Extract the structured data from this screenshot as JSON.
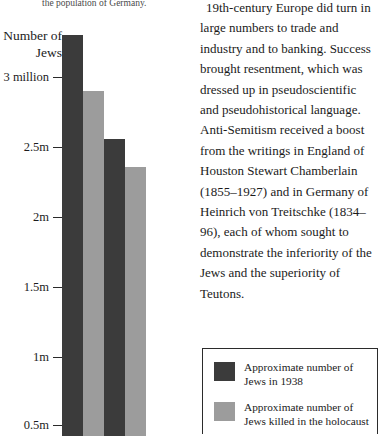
{
  "document": {
    "cropped_top_line": "the population of Germany."
  },
  "chart_data": {
    "type": "bar",
    "title": "Number of Jews",
    "xlabel": "",
    "ylabel": "Number of Jews",
    "ylim": [
      0.5,
      3.4
    ],
    "grid": false,
    "categories": [
      "Group 1",
      "Group 2"
    ],
    "tick_labels": [
      "3 million",
      "2.5m",
      "2m",
      "1.5m",
      "1m",
      "0.5m"
    ],
    "tick_values": [
      3.0,
      2.5,
      2.0,
      1.5,
      1.0,
      0.5
    ],
    "series": [
      {
        "name": "Approximate number of Jews in 1938",
        "color": "#3b3b3b",
        "values": [
          3.3,
          2.55
        ]
      },
      {
        "name": "Approximate number of Jews killed in the holocaust",
        "color": "#9c9c9c",
        "values": [
          2.9,
          2.35
        ]
      }
    ],
    "bars": [
      {
        "label": "Approximate number of Jews in 1938",
        "value": 3.3,
        "style": "dark"
      },
      {
        "label": "Approximate number of Jews killed in the holocaust",
        "value": 2.9,
        "style": "light"
      },
      {
        "label": "Approximate number of Jews in 1938",
        "value": 2.55,
        "style": "dark"
      },
      {
        "label": "Approximate number of Jews killed in the holocaust",
        "value": 2.35,
        "style": "light"
      }
    ],
    "legend_position": "bottom-right"
  },
  "axis": {
    "ticks": [
      {
        "label": "3 million"
      },
      {
        "label": "2.5m"
      },
      {
        "label": "2m"
      },
      {
        "label": "1.5m"
      },
      {
        "label": "1m"
      },
      {
        "label": "0.5m"
      }
    ]
  },
  "article": {
    "paragraph": "19th-century Europe did turn in large numbers to trade and industry and to banking. Success brought resentment, which was dressed up in pseudoscientific and pseudohistorical language. Anti-Semitism received a boost from the writings in England of Houston Stewart Chamberlain (1855–1927) and in Germany of Heinrich von Treitschke (1834–96), each of whom sought to demonstrate the inferiority of the Jews and the superiority of Teutons."
  },
  "legend": {
    "items": [
      {
        "swatch_color": "#3b3b3b",
        "label": "Approximate number of Jews in 1938"
      },
      {
        "swatch_color": "#9c9c9c",
        "label": "Approximate number of Jews killed in the holocaust"
      }
    ]
  }
}
